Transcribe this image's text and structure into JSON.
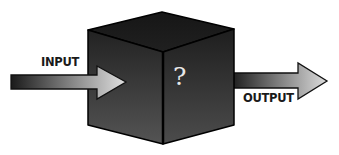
{
  "diagram": {
    "input": {
      "label": "INPUT"
    },
    "box": {
      "label": "?",
      "description": "black box"
    },
    "output": {
      "label": "OUTPUT"
    },
    "colors": {
      "cube_top": "#1c1c1c",
      "cube_left_top": "#262626",
      "cube_left_bottom": "#505050",
      "cube_right_top": "#222222",
      "cube_right_bottom": "#4a4a4a",
      "edge": "#000000",
      "arrow_dark": "#1e1e1e",
      "arrow_light": "#d8d8d8",
      "question_mark": "#e8e8e8",
      "text": "#1a1a1a"
    }
  }
}
